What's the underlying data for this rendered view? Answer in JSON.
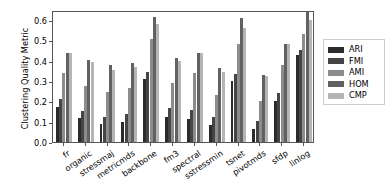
{
  "chart_data": {
    "type": "bar",
    "title": "",
    "xlabel": "",
    "ylabel": "Clustering Quality Metric",
    "ylim": [
      0.0,
      0.65
    ],
    "yticks": [
      "0.0",
      "0.1",
      "0.2",
      "0.3",
      "0.4",
      "0.5",
      "0.6"
    ],
    "ytick_values": [
      0.0,
      0.1,
      0.2,
      0.3,
      0.4,
      0.5,
      0.6
    ],
    "grid": false,
    "legend_position": "right",
    "categories": [
      "fr",
      "organic",
      "stressmaj",
      "metricmds",
      "backbone",
      "fm3",
      "spectral",
      "sstressmin",
      "tsnet",
      "pivotmds",
      "sfdp",
      "linlog"
    ],
    "series": [
      {
        "name": "ARI",
        "color": "#2b2b2b",
        "values": [
          0.17,
          0.118,
          0.088,
          0.099,
          0.312,
          0.125,
          0.112,
          0.083,
          0.3,
          0.065,
          0.202,
          0.428
        ]
      },
      {
        "name": "FMI",
        "color": "#454545",
        "values": [
          0.211,
          0.155,
          0.122,
          0.14,
          0.344,
          0.166,
          0.158,
          0.125,
          0.333,
          0.105,
          0.24,
          0.455
        ]
      },
      {
        "name": "AMI",
        "color": "#8c8c8c",
        "values": [
          0.342,
          0.278,
          0.245,
          0.265,
          0.505,
          0.29,
          0.34,
          0.232,
          0.482,
          0.204,
          0.38,
          0.531
        ]
      },
      {
        "name": "HOM",
        "color": "#616161",
        "values": [
          0.438,
          0.402,
          0.38,
          0.39,
          0.617,
          0.414,
          0.437,
          0.365,
          0.61,
          0.33,
          0.484,
          0.638
        ]
      },
      {
        "name": "CMP",
        "color": "#b5b5b5",
        "values": [
          0.44,
          0.392,
          0.357,
          0.37,
          0.58,
          0.399,
          0.437,
          0.345,
          0.561,
          0.325,
          0.484,
          0.601
        ]
      }
    ]
  },
  "legend": {
    "entries": [
      "ARI",
      "FMI",
      "AMI",
      "HOM",
      "CMP"
    ]
  },
  "axes": {
    "y_title": "Clustering Quality Metric"
  }
}
